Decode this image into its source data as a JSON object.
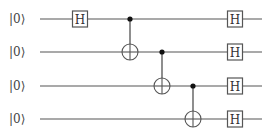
{
  "diagram": {
    "type": "quantum-circuit",
    "qubits": [
      {
        "label": "|0⟩",
        "y": 19
      },
      {
        "label": "|0⟩",
        "y": 52
      },
      {
        "label": "|0⟩",
        "y": 86
      },
      {
        "label": "|0⟩",
        "y": 119
      }
    ],
    "wire_start_x": 40,
    "wire_end_x": 262,
    "gates": [
      {
        "type": "H",
        "label": "H",
        "qubit": 0,
        "x": 80
      },
      {
        "type": "CNOT",
        "control": 0,
        "target": 1,
        "x": 130
      },
      {
        "type": "CNOT",
        "control": 1,
        "target": 2,
        "x": 162
      },
      {
        "type": "CNOT",
        "control": 2,
        "target": 3,
        "x": 193
      },
      {
        "type": "H",
        "label": "H",
        "qubit": 0,
        "x": 235
      },
      {
        "type": "H",
        "label": "H",
        "qubit": 1,
        "x": 235
      },
      {
        "type": "H",
        "label": "H",
        "qubit": 2,
        "x": 235
      },
      {
        "type": "H",
        "label": "H",
        "qubit": 3,
        "x": 235
      }
    ]
  }
}
